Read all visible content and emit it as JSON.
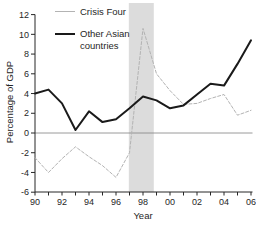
{
  "figure": {
    "width": 256,
    "height": 227,
    "background": "#ffffff"
  },
  "labels": {
    "ylabel": "Percentage of GDP",
    "xlabel": "Year"
  },
  "colors": {
    "axis": "#262626",
    "zero_line": "#808080",
    "crisis_band": "#dcdcdc",
    "tick_text": "#262626"
  },
  "chart_data": {
    "type": "line",
    "title": "",
    "xlabel": "Year",
    "ylabel": "Percentage of GDP",
    "x": [
      1990,
      1991,
      1992,
      1993,
      1994,
      1995,
      1996,
      1997,
      1998,
      1999,
      2000,
      2001,
      2002,
      2003,
      2004,
      2005,
      2006
    ],
    "x_tick_labels": [
      "90",
      "92",
      "94",
      "96",
      "98",
      "00",
      "02",
      "04",
      "06"
    ],
    "yticks": [
      -6,
      -4,
      -2,
      0,
      2,
      4,
      6,
      8,
      10,
      12
    ],
    "ylim": [
      -6,
      12
    ],
    "grid": false,
    "legend_position": "top-left",
    "zero_line": true,
    "shaded_region": {
      "from_year": 1996.95,
      "to_year": 1998.8,
      "color": "#dcdcdc"
    },
    "series": [
      {
        "name": "Crisis Four",
        "color": "#b3b3b3",
        "style": "dashed",
        "width": 1,
        "values": [
          -2.5,
          -4.0,
          -2.6,
          -1.4,
          -2.4,
          -3.3,
          -4.5,
          -2.0,
          10.6,
          6.0,
          4.3,
          2.9,
          3.0,
          3.5,
          3.9,
          1.8,
          2.3
        ]
      },
      {
        "name": "Other Asian countries",
        "color": "#1a1a1a",
        "style": "solid",
        "width": 2,
        "values": [
          4.0,
          4.4,
          3.0,
          0.3,
          2.2,
          1.1,
          1.4,
          2.5,
          3.7,
          3.3,
          2.5,
          2.8,
          3.9,
          5.0,
          4.8,
          7.0,
          9.4
        ]
      }
    ]
  }
}
